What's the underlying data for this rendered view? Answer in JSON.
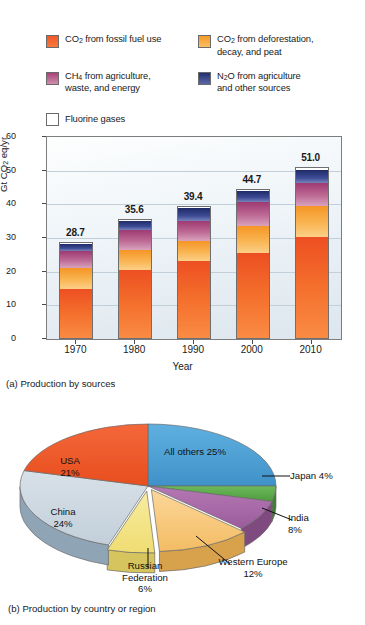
{
  "legend": {
    "items": [
      {
        "label_html": "CO<sub>2</sub> from fossil fuel use",
        "label": "CO2 from fossil fuel use",
        "color": "#f2562a",
        "name": "legend-co2-fossil"
      },
      {
        "label_html": "CO<sub>2</sub> from deforestation, decay, and peat",
        "label": "CO2 from deforestation, decay, and peat",
        "color": "#f59a2a",
        "name": "legend-co2-deforestation"
      },
      {
        "label_html": "CH<sub>4</sub> from agriculture, waste, and energy",
        "label": "CH4 from agriculture, waste, and energy",
        "color": "#b85a8a",
        "name": "legend-ch4-agriculture"
      },
      {
        "label_html": "N<sub>2</sub>O from agriculture and other sources",
        "label": "N2O from agriculture and other sources",
        "color": "#2a3a80",
        "name": "legend-n2o-agriculture"
      },
      {
        "label_html": "Fluorine gases",
        "label": "Fluorine gases",
        "color": "#ffffff",
        "name": "legend-fluorine-gases"
      }
    ]
  },
  "chart_data": [
    {
      "type": "bar",
      "subtype": "stacked-bar",
      "name": "production-by-sources",
      "title": "",
      "caption": "(a) Production by sources",
      "xlabel": "Year",
      "ylabel": "Gt CO2 eq/yr",
      "ylabel_html": "Gt CO<sub>2</sub> eq/yr",
      "categories": [
        "1970",
        "1980",
        "1990",
        "2000",
        "2010"
      ],
      "ylim": [
        0,
        60
      ],
      "yticks": [
        0,
        10,
        20,
        30,
        40,
        50,
        60
      ],
      "grid": true,
      "totals": [
        "28.7",
        "35.6",
        "39.4",
        "44.7",
        "51.0"
      ],
      "series": [
        {
          "name": "CO2 from fossil fuel use",
          "key": "fossil",
          "color": "#f2562a",
          "values": [
            14.8,
            20.5,
            23.1,
            25.6,
            30.3
          ]
        },
        {
          "name": "CO2 from deforestation, decay, and peat",
          "key": "deforestation",
          "color": "#f59a2a",
          "values": [
            6.2,
            5.8,
            5.9,
            8.1,
            9.2
          ]
        },
        {
          "name": "CH4 from agriculture, waste, and energy",
          "key": "ch4",
          "color": "#b85a8a",
          "values": [
            5.3,
            6.2,
            6.2,
            7.1,
            6.8
          ]
        },
        {
          "name": "N2O from agriculture and other sources",
          "key": "n2o",
          "color": "#2a3a80",
          "values": [
            2.0,
            2.5,
            3.6,
            3.3,
            4.0
          ]
        },
        {
          "name": "Fluorine gases",
          "key": "fluorine",
          "color": "#ffffff",
          "values": [
            0.4,
            0.6,
            0.6,
            0.6,
            0.7
          ]
        }
      ]
    },
    {
      "type": "pie",
      "subtype": "3d-pie",
      "name": "production-by-country-or-region",
      "title": "",
      "caption": "(b) Production by country or region",
      "slices": [
        {
          "label": "All others 25%",
          "name": "All others",
          "value": 25,
          "color": "#4a9fd4",
          "placement": "inside"
        },
        {
          "label": "Japan 4%",
          "name": "Japan",
          "value": 4,
          "color": "#5ba84a",
          "placement": "callout"
        },
        {
          "label": "India\n8%",
          "name": "India",
          "value": 8,
          "color": "#a968a8",
          "placement": "callout"
        },
        {
          "label": "Western Europe\n12%",
          "name": "Western Europe",
          "value": 12,
          "color": "#f5c878",
          "placement": "callout"
        },
        {
          "label": "Russian\nFederation\n6%",
          "name": "Russian Federation",
          "value": 6,
          "color": "#f2e08a",
          "placement": "callout"
        },
        {
          "label": "China\n24%",
          "name": "China",
          "value": 24,
          "color": "#cdd8e0",
          "placement": "inside"
        },
        {
          "label": "USA\n21%",
          "name": "USA",
          "value": 21,
          "color": "#f05a28",
          "placement": "inside"
        }
      ],
      "labels": {
        "all_others": "All others 25%",
        "japan": "Japan 4%",
        "india_l1": "India",
        "india_l2": "8%",
        "western_europe_l1": "Western Europe",
        "western_europe_l2": "12%",
        "russia_l1": "Russian",
        "russia_l2": "Federation",
        "russia_l3": "6%",
        "china_l1": "China",
        "china_l2": "24%",
        "usa_l1": "USA",
        "usa_l2": "21%"
      }
    }
  ],
  "colors": {
    "fossil": "#f2562a",
    "deforestation": "#f59a2a",
    "ch4": "#b85a8a",
    "n2o": "#2a3a80",
    "fluorine": "#ffffff",
    "plot_bg_top": "#fdfefe",
    "plot_bg_bottom": "#dde6ee",
    "axis": "#4a4a4a"
  }
}
